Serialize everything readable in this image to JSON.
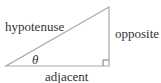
{
  "diagram": {
    "type": "right-triangle",
    "labels": {
      "hypotenuse": "hypotenuse",
      "opposite": "opposite",
      "adjacent": "adjacent",
      "angle": "θ"
    },
    "colors": {
      "stroke": "#aaaaaa",
      "text": "#333333"
    }
  }
}
